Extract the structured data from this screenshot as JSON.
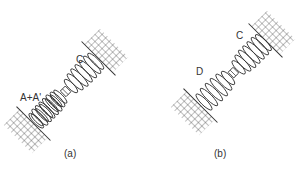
{
  "panels": [
    {
      "id": "a",
      "caption": "(a)",
      "labels": {
        "upper_coil": "C",
        "lower_coil": "A+A'"
      }
    },
    {
      "id": "b",
      "caption": "(b)",
      "labels": {
        "upper_coil": "C",
        "lower_coil": "D"
      }
    }
  ],
  "colors": {
    "stroke": "#333333",
    "background": "#ffffff"
  }
}
